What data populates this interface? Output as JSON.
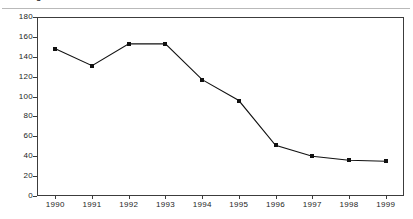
{
  "caption": {
    "text": "Figure"
  },
  "chart_data": {
    "type": "line",
    "title": "",
    "subtitle": "",
    "xlabel": "",
    "ylabel": "",
    "categories": [
      "1990",
      "1991",
      "1992",
      "1993",
      "1994",
      "1995",
      "1996",
      "1997",
      "1998",
      "1999"
    ],
    "values": [
      148,
      131,
      153,
      153,
      117,
      96,
      51,
      40,
      36,
      35
    ],
    "series": [
      {
        "name": "series-1",
        "values": [
          148,
          131,
          153,
          153,
          117,
          96,
          51,
          40,
          36,
          35
        ],
        "color": "#111111",
        "marker": "square"
      }
    ],
    "ylim": [
      0,
      180
    ],
    "ytick_labels": [
      "0",
      "20",
      "40",
      "60",
      "80",
      "100",
      "120",
      "140",
      "160",
      "180"
    ],
    "ytick_values": [
      0,
      20,
      40,
      60,
      80,
      100,
      120,
      140,
      160,
      180
    ],
    "xtick_labels": [
      "1990",
      "1991",
      "1992",
      "1993",
      "1994",
      "1995",
      "1996",
      "1997",
      "1998",
      "1999"
    ],
    "grid": false,
    "legend": "none",
    "frame": true
  },
  "colors": {
    "line": "#111111",
    "marker": "#111111",
    "frame": "#3c3c3c",
    "text": "#1d1d1d",
    "background": "#ffffff"
  }
}
